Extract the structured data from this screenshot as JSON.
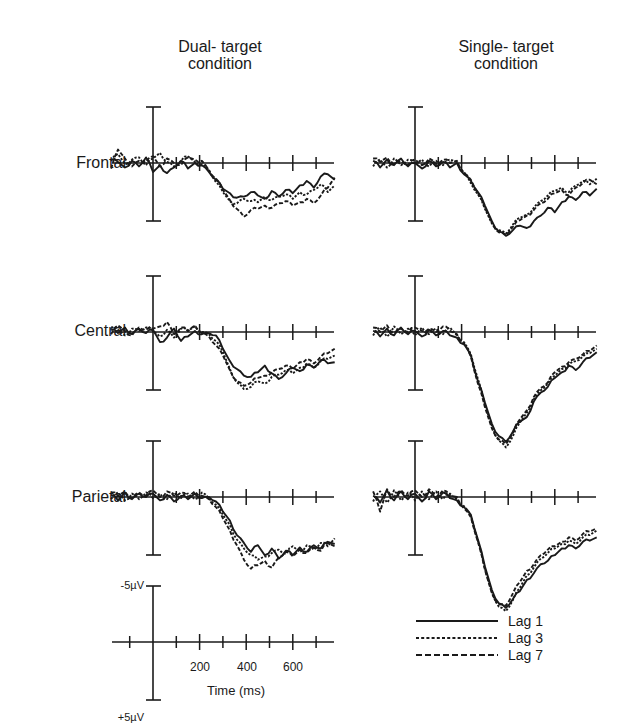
{
  "header": {
    "col1_line1": "Dual- target",
    "col1_line2": "condition",
    "col2_line1": "Single- target",
    "col2_line2": "condition"
  },
  "rows": [
    "Frontal",
    "Central",
    "Parietal"
  ],
  "scale": {
    "top_label": "-5µV",
    "bottom_label": "+5µV",
    "x_tick_labels": [
      "200",
      "400",
      "600"
    ],
    "xlabel": "Time (ms)"
  },
  "legend": [
    {
      "label": "Lag 1",
      "style": "solid"
    },
    {
      "label": "Lag 3",
      "style": "dotted"
    },
    {
      "label": "Lag 7",
      "style": "dashed"
    }
  ],
  "colors": {
    "ink": "#1a1a1a",
    "background": "#ffffff"
  },
  "chart_data": {
    "type": "line",
    "xlabel": "Time (ms)",
    "ylabel": "Amplitude (µV, negative up)",
    "xlim": [
      -180,
      780
    ],
    "x_ticks": [
      -100,
      0,
      100,
      200,
      300,
      400,
      500,
      600,
      700
    ],
    "y_scale_bar": [
      -5,
      5
    ],
    "legend_position": "bottom-right",
    "x": [
      -180,
      -150,
      -120,
      -90,
      -60,
      -30,
      0,
      30,
      60,
      90,
      120,
      150,
      180,
      210,
      240,
      270,
      300,
      330,
      360,
      390,
      420,
      450,
      480,
      510,
      540,
      570,
      600,
      630,
      660,
      690,
      720,
      750,
      780
    ],
    "panels": [
      {
        "row": "Frontal",
        "condition": "Dual-target",
        "series": [
          {
            "name": "Lag 1",
            "values": [
              0.3,
              0.1,
              -0.4,
              0.2,
              -0.3,
              0.5,
              -0.8,
              -0.2,
              -0.9,
              -0.4,
              0.2,
              -0.5,
              0.0,
              -0.2,
              -0.8,
              -1.5,
              -2.3,
              -2.7,
              -3.1,
              -3.0,
              -2.6,
              -2.9,
              -3.2,
              -2.5,
              -3.0,
              -2.4,
              -2.7,
              -2.0,
              -1.6,
              -2.2,
              -1.2,
              -1.0,
              -1.5
            ]
          },
          {
            "name": "Lag 3",
            "values": [
              0.2,
              0.8,
              -0.1,
              0.3,
              0.5,
              -0.2,
              0.4,
              0.9,
              0.1,
              -0.3,
              0.2,
              0.6,
              0.1,
              -0.1,
              -0.6,
              -1.7,
              -2.6,
              -3.4,
              -3.6,
              -3.2,
              -3.4,
              -3.5,
              -3.0,
              -3.3,
              -3.0,
              -2.8,
              -3.2,
              -2.6,
              -2.8,
              -2.4,
              -1.9,
              -2.6,
              -2.0
            ]
          },
          {
            "name": "Lag 7",
            "values": [
              -0.5,
              1.2,
              0.4,
              -0.3,
              0.2,
              0.1,
              0.6,
              -0.3,
              0.4,
              0.0,
              -0.2,
              0.5,
              0.3,
              0.2,
              -0.7,
              -1.4,
              -2.4,
              -3.3,
              -4.1,
              -4.8,
              -4.2,
              -4.1,
              -3.8,
              -4.0,
              -3.6,
              -3.4,
              -3.8,
              -3.5,
              -3.2,
              -3.6,
              -2.9,
              -2.2,
              -1.3
            ]
          }
        ]
      },
      {
        "row": "Frontal",
        "condition": "Single-target",
        "series": [
          {
            "name": "Lag 1",
            "values": [
              0.2,
              -0.4,
              0.3,
              -0.2,
              0.4,
              -0.3,
              0.0,
              -0.5,
              0.2,
              -0.3,
              0.1,
              -0.4,
              0.0,
              -1.0,
              -1.6,
              -2.6,
              -3.8,
              -5.2,
              -6.1,
              -6.5,
              -6.0,
              -5.6,
              -5.8,
              -5.2,
              -4.7,
              -4.0,
              -4.4,
              -3.5,
              -3.0,
              -3.3,
              -2.6,
              -2.9,
              -2.3
            ]
          },
          {
            "name": "Lag 3",
            "values": [
              -0.3,
              0.3,
              -0.4,
              0.4,
              -0.2,
              0.3,
              -0.1,
              0.3,
              -0.3,
              0.2,
              -0.2,
              0.3,
              0.1,
              -0.8,
              -1.8,
              -2.8,
              -4.1,
              -5.4,
              -6.0,
              -6.3,
              -5.5,
              -4.9,
              -4.6,
              -4.0,
              -3.4,
              -2.9,
              -2.5,
              -2.2,
              -2.6,
              -2.0,
              -1.6,
              -1.9,
              -1.4
            ]
          },
          {
            "name": "Lag 7",
            "values": [
              0.4,
              0.1,
              0.5,
              -0.1,
              0.2,
              -0.2,
              0.3,
              -0.2,
              0.4,
              -0.1,
              0.3,
              0.0,
              0.2,
              -0.9,
              -1.5,
              -2.7,
              -4.0,
              -5.3,
              -6.2,
              -6.4,
              -5.7,
              -5.1,
              -4.7,
              -4.2,
              -3.6,
              -3.2,
              -2.7,
              -2.4,
              -2.9,
              -2.2,
              -1.8,
              -1.5,
              -1.9
            ]
          }
        ]
      },
      {
        "row": "Central",
        "condition": "Dual-target",
        "series": [
          {
            "name": "Lag 1",
            "values": [
              0.2,
              -0.1,
              0.4,
              -0.2,
              0.3,
              -0.1,
              0.2,
              -0.9,
              -0.5,
              0.3,
              -0.8,
              -0.4,
              0.1,
              -0.2,
              -0.1,
              -0.3,
              -1.5,
              -2.6,
              -3.3,
              -3.9,
              -4.0,
              -3.6,
              -3.0,
              -3.7,
              -4.2,
              -3.7,
              -3.2,
              -3.5,
              -2.9,
              -3.2,
              -2.5,
              -2.8,
              -2.7
            ]
          },
          {
            "name": "Lag 3",
            "values": [
              0.4,
              0.2,
              -0.3,
              0.3,
              0.1,
              0.4,
              0.1,
              -0.4,
              0.2,
              -0.5,
              0.3,
              0.1,
              0.5,
              0.0,
              -0.2,
              -0.8,
              -1.8,
              -3.3,
              -4.5,
              -5.1,
              -4.9,
              -4.4,
              -4.6,
              -4.0,
              -3.8,
              -3.4,
              -3.7,
              -3.2,
              -2.8,
              -3.2,
              -2.6,
              -2.4,
              -2.1
            ]
          },
          {
            "name": "Lag 7",
            "values": [
              -0.2,
              0.6,
              0.1,
              -0.3,
              0.4,
              0.2,
              0.3,
              0.5,
              0.9,
              -0.2,
              0.4,
              0.1,
              0.6,
              -0.1,
              -0.4,
              -1.2,
              -2.1,
              -3.4,
              -4.4,
              -4.8,
              -4.5,
              -4.1,
              -3.9,
              -3.6,
              -3.3,
              -3.0,
              -3.3,
              -2.7,
              -2.4,
              -2.8,
              -2.2,
              -1.9,
              -1.5
            ]
          }
        ]
      },
      {
        "row": "Central",
        "condition": "Single-target",
        "series": [
          {
            "name": "Lag 1",
            "values": [
              0.1,
              -0.4,
              0.3,
              -0.3,
              0.4,
              -0.2,
              0.1,
              -0.4,
              0.2,
              -0.3,
              0.1,
              -0.3,
              -0.5,
              -1.1,
              -2.1,
              -4.4,
              -6.3,
              -8.2,
              -9.3,
              -9.8,
              -8.9,
              -8.0,
              -7.6,
              -6.2,
              -5.4,
              -4.9,
              -4.1,
              -3.6,
              -3.0,
              -3.4,
              -2.7,
              -2.3,
              -1.8
            ]
          },
          {
            "name": "Lag 3",
            "values": [
              -0.3,
              0.4,
              -0.4,
              0.5,
              -0.2,
              0.3,
              -0.3,
              0.4,
              -0.2,
              0.3,
              -0.2,
              0.4,
              -0.3,
              -0.9,
              -2.0,
              -4.2,
              -6.5,
              -8.4,
              -9.7,
              -10.3,
              -9.3,
              -8.1,
              -7.2,
              -6.0,
              -5.2,
              -4.6,
              -3.9,
              -3.3,
              -2.9,
              -2.6,
              -2.2,
              -1.9,
              -1.5
            ]
          },
          {
            "name": "Lag 7",
            "values": [
              0.4,
              0.0,
              0.6,
              -0.1,
              0.3,
              0.0,
              0.4,
              0.1,
              0.3,
              0.0,
              0.5,
              0.1,
              -0.2,
              -1.0,
              -2.2,
              -4.6,
              -6.7,
              -8.6,
              -9.6,
              -10.0,
              -9.0,
              -7.8,
              -7.0,
              -5.8,
              -5.0,
              -4.5,
              -3.6,
              -3.1,
              -2.7,
              -2.4,
              -2.0,
              -1.7,
              -1.2
            ]
          }
        ]
      },
      {
        "row": "Parietal",
        "condition": "Dual-target",
        "series": [
          {
            "name": "Lag 1",
            "values": [
              0.2,
              -0.3,
              0.4,
              -0.2,
              0.3,
              0.0,
              0.3,
              -0.3,
              0.2,
              -0.4,
              0.1,
              -0.2,
              0.3,
              -0.1,
              0.0,
              -0.4,
              -1.3,
              -2.1,
              -3.4,
              -4.1,
              -4.9,
              -4.3,
              -5.2,
              -4.6,
              -5.5,
              -4.8,
              -5.2,
              -4.5,
              -4.9,
              -4.3,
              -4.6,
              -4.0,
              -4.2
            ]
          },
          {
            "name": "Lag 3",
            "values": [
              -0.2,
              0.4,
              -0.3,
              0.3,
              -0.2,
              0.4,
              -0.1,
              0.3,
              -0.2,
              0.4,
              -0.1,
              0.3,
              -0.2,
              0.4,
              -0.1,
              -0.7,
              -1.6,
              -2.5,
              -3.8,
              -4.6,
              -5.2,
              -5.6,
              -5.3,
              -5.0,
              -4.7,
              -5.1,
              -4.4,
              -4.9,
              -4.3,
              -4.7,
              -4.1,
              -4.4,
              -3.7
            ]
          },
          {
            "name": "Lag 7",
            "values": [
              0.4,
              0.1,
              0.5,
              -0.1,
              0.4,
              0.1,
              0.6,
              0.0,
              0.5,
              0.1,
              0.4,
              0.0,
              0.5,
              0.1,
              -0.2,
              -0.9,
              -1.9,
              -3.0,
              -4.3,
              -5.6,
              -6.4,
              -6.1,
              -5.7,
              -6.3,
              -5.4,
              -4.9,
              -5.3,
              -4.7,
              -5.0,
              -4.5,
              -4.8,
              -4.1,
              -4.4
            ]
          }
        ]
      },
      {
        "row": "Parietal",
        "condition": "Single-target",
        "series": [
          {
            "name": "Lag 1",
            "values": [
              0.1,
              -0.5,
              0.6,
              -0.3,
              0.5,
              -0.2,
              0.3,
              -0.4,
              0.5,
              -0.2,
              0.4,
              -0.1,
              -0.3,
              -0.9,
              -1.6,
              -3.8,
              -6.2,
              -8.3,
              -9.5,
              -9.9,
              -9.1,
              -8.4,
              -7.4,
              -6.8,
              -6.0,
              -5.7,
              -5.2,
              -4.6,
              -4.3,
              -4.6,
              -4.0,
              -3.9,
              -3.6
            ]
          },
          {
            "name": "Lag 3",
            "values": [
              -0.4,
              0.5,
              -0.5,
              0.6,
              -0.3,
              0.4,
              -0.3,
              0.5,
              -0.2,
              0.5,
              -0.2,
              0.3,
              -0.2,
              -0.8,
              -1.7,
              -3.9,
              -6.4,
              -8.5,
              -9.8,
              -10.2,
              -9.2,
              -8.1,
              -7.0,
              -6.3,
              -5.5,
              -5.0,
              -4.6,
              -4.2,
              -3.9,
              -4.2,
              -3.6,
              -3.4,
              -3.0
            ]
          },
          {
            "name": "Lag 7",
            "values": [
              0.5,
              -1.3,
              0.7,
              0.0,
              0.6,
              0.1,
              0.6,
              0.0,
              0.7,
              0.0,
              0.6,
              0.1,
              0.0,
              -1.0,
              -1.8,
              -4.0,
              -6.5,
              -8.6,
              -9.6,
              -9.7,
              -8.6,
              -7.6,
              -6.6,
              -6.0,
              -5.2,
              -4.7,
              -4.4,
              -4.0,
              -3.6,
              -3.9,
              -3.3,
              -3.1,
              -2.8
            ]
          }
        ]
      }
    ]
  }
}
